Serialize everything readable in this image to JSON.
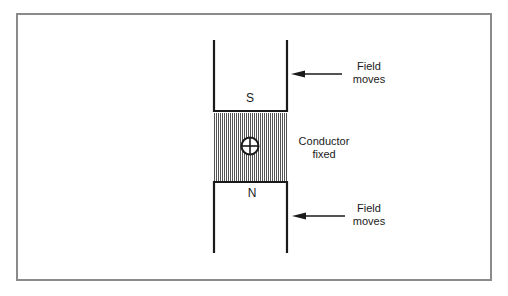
{
  "diagram": {
    "top_magnet": {
      "pole_label": "S"
    },
    "bottom_magnet": {
      "pole_label": "N"
    },
    "conductor": {
      "label_line1": "Conductor",
      "label_line2": "fixed",
      "symbol": "current-into-page-cross-circle-icon"
    },
    "top_arrow": {
      "label_line1": "Field",
      "label_line2": "moves",
      "direction": "left"
    },
    "bottom_arrow": {
      "label_line1": "Field",
      "label_line2": "moves",
      "direction": "left"
    },
    "colors": {
      "line": "#1a1a1a",
      "frame": "#8a8a8a",
      "hatch": "#555555",
      "background": "#ffffff"
    }
  }
}
